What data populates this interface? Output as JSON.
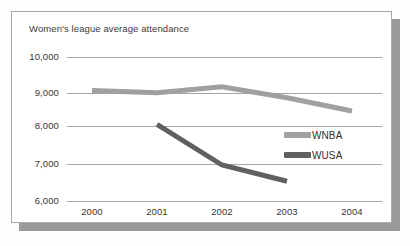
{
  "figure": {
    "title": "Women's league average attendance",
    "frame_border_color": "#a8a8a8",
    "shadow_color": "#9a9a9a",
    "background_color": "#ffffff"
  },
  "legend": {
    "position": "right-center",
    "entries": [
      {
        "label": "WNBA",
        "color": "#a0a0a0",
        "swatch_name": "legend-swatch-wnba"
      },
      {
        "label": "WUSA",
        "color": "#606060",
        "swatch_name": "legend-swatch-wusa"
      }
    ]
  },
  "axes": {
    "y_tick_labels": [
      "10,000",
      "9,000",
      "8,000",
      "7,000",
      "6,000"
    ],
    "x_tick_labels": [
      "2000",
      "2001",
      "2002",
      "2003",
      "2004"
    ]
  },
  "chart_data": {
    "type": "line",
    "title": "Women's league average attendance",
    "xlabel": "",
    "ylabel": "",
    "categories": [
      "2000",
      "2001",
      "2002",
      "2003",
      "2004"
    ],
    "x": [
      2000,
      2001,
      2002,
      2003,
      2004
    ],
    "ylim": [
      6000,
      10000
    ],
    "yticks": [
      6000,
      7000,
      8000,
      9000,
      10000
    ],
    "ytick_labels": [
      "6,000",
      "7,000",
      "8,000",
      "9,000",
      "10,000"
    ],
    "grid": true,
    "grid_axis": "y",
    "legend_position": "right-center",
    "series": [
      {
        "name": "WNBA",
        "color": "#a0a0a0",
        "line_width": 5,
        "x": [
          2000,
          2001,
          2002,
          2003,
          2004
        ],
        "values": [
          9070,
          9010,
          9170,
          8870,
          8500
        ]
      },
      {
        "name": "WUSA",
        "color": "#606060",
        "line_width": 5,
        "x": [
          2001,
          2002,
          2003
        ],
        "values": [
          8130,
          7000,
          6550
        ]
      }
    ]
  }
}
